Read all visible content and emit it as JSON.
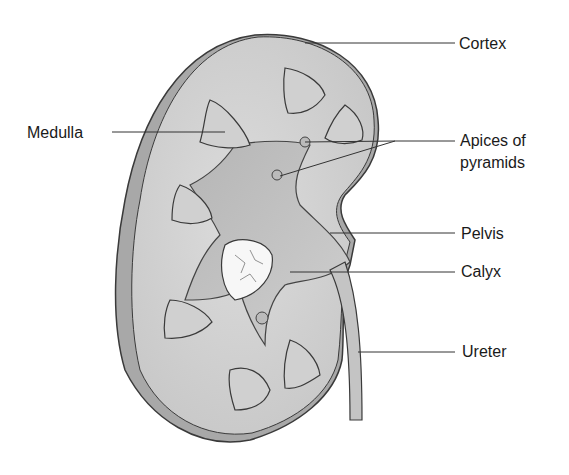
{
  "colors": {
    "background": "#ffffff",
    "tissue": "#d6d6d6",
    "tissue_dark": "#b8b8b8",
    "capsule": "#9a9a9a",
    "outline": "#3a3a3a",
    "leader_line": "#333333",
    "label_text": "#1a1a1a"
  },
  "labels": [
    {
      "id": "cortex",
      "text": "Cortex",
      "x": 459,
      "y": 34
    },
    {
      "id": "medulla",
      "text": "Medulla",
      "x": 27,
      "y": 123
    },
    {
      "id": "apices1",
      "text": "Apices of",
      "x": 460,
      "y": 131
    },
    {
      "id": "apices2",
      "text": "pyramids",
      "x": 460,
      "y": 153
    },
    {
      "id": "pelvis",
      "text": "Pelvis",
      "x": 461,
      "y": 224
    },
    {
      "id": "calyx",
      "text": "Calyx",
      "x": 461,
      "y": 262
    },
    {
      "id": "ureter",
      "text": "Ureter",
      "x": 462,
      "y": 342
    }
  ]
}
